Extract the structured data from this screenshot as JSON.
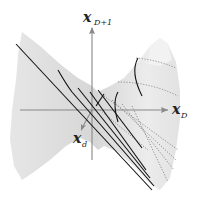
{
  "figure": {
    "axes": {
      "vertical": {
        "base": "x",
        "subscript": "D+1"
      },
      "horizontal": {
        "base": "x",
        "subscript": "D"
      },
      "depth": {
        "base": "x",
        "subscript": "d"
      }
    },
    "colors": {
      "surface_light": "#ececec",
      "surface_mid": "#dcdcdc",
      "surface_dark": "#cfcfcf",
      "axis": "#888888",
      "ruling_solid": "#111111",
      "ruling_dotted": "#777777"
    }
  }
}
